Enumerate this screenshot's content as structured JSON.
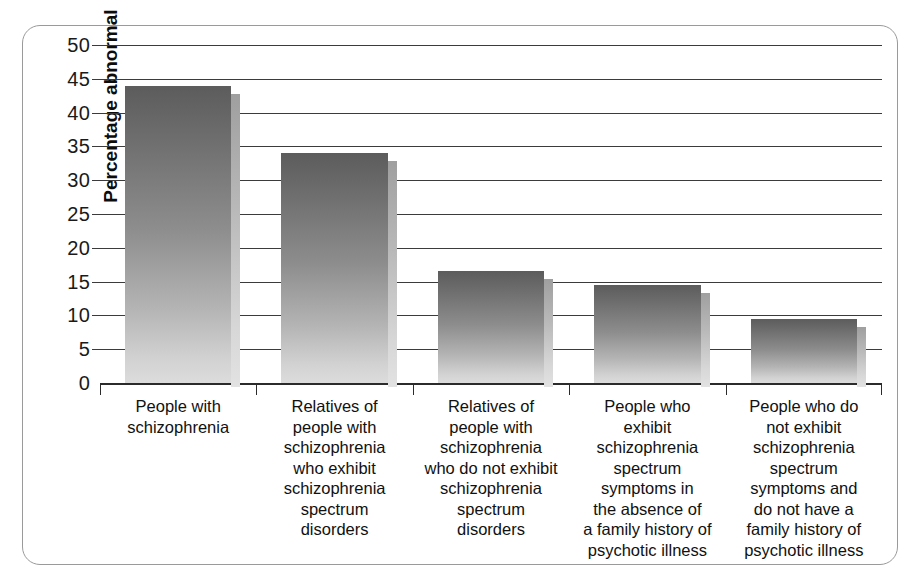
{
  "chart_data": {
    "type": "bar",
    "title": "",
    "xlabel": "",
    "ylabel": "Percentage abnormal",
    "ylim": [
      0,
      50
    ],
    "yticks": [
      0,
      5,
      10,
      15,
      20,
      25,
      30,
      35,
      40,
      45,
      50
    ],
    "grid": true,
    "legend": "none",
    "categories": [
      "People with schizophrenia",
      "Relatives of people with schizophrenia who exhibit schizophrenia spectrum disorders",
      "Relatives of people with schizophrenia who do not exhibit schizophrenia spectrum disorders",
      "People who exhibit schizophrenia spectrum symptoms in the absence of a family history of psychotic illness",
      "People who do not exhibit schizophrenia spectrum symptoms and do not have a family history of psychotic illness"
    ],
    "category_lines": [
      [
        "People with",
        "schizophrenia"
      ],
      [
        "Relatives of",
        "people with",
        "schizophrenia",
        "who exhibit",
        "schizophrenia",
        "spectrum",
        "disorders"
      ],
      [
        "Relatives of",
        "people with",
        "schizophrenia",
        "who do not exhibit",
        "schizophrenia",
        "spectrum",
        "disorders"
      ],
      [
        "People who",
        "exhibit",
        "schizophrenia",
        "spectrum",
        "symptoms in",
        "the absence of",
        "a family history of",
        "psychotic illness"
      ],
      [
        "People who do",
        "not exhibit",
        "schizophrenia",
        "spectrum",
        "symptoms and",
        "do not have a",
        "family history of",
        "psychotic illness"
      ]
    ],
    "values": [
      44,
      34,
      16.5,
      14.5,
      9.5
    ]
  },
  "style": {
    "bar_color_top": "#5c5c5c",
    "bar_color_bottom": "#dcdcdc",
    "gridline_color": "#3b3b3b",
    "frame_color": "#9a9a9a",
    "text_color": "#111111"
  }
}
